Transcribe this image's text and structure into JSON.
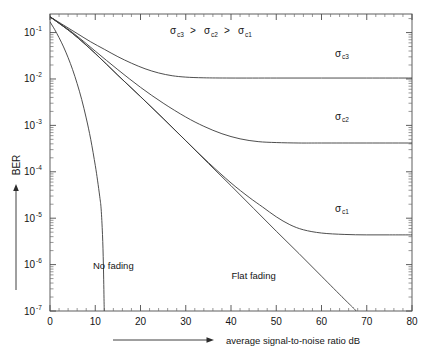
{
  "chart_data": {
    "type": "line",
    "title": "",
    "subtitle": "",
    "xlabel": "average signal-to-noise ratio  dB",
    "ylabel": "BER",
    "xlim": [
      0,
      80
    ],
    "ylim_log": [
      -7,
      -0.6
    ],
    "x_ticks": [
      0,
      10,
      20,
      30,
      40,
      50,
      60,
      70,
      80
    ],
    "x_tick_labels": [
      "0",
      "10",
      "20",
      "30",
      "40",
      "50",
      "60",
      "70",
      "80"
    ],
    "y_ticks_exponent": [
      -1,
      -2,
      -3,
      -4,
      -5,
      -6,
      -7
    ],
    "y_tick_labels": [
      "10-1",
      "10-2",
      "10-3",
      "10-4",
      "10-5",
      "10-6",
      "10-7"
    ],
    "y_tick_base": "10",
    "y_tick_exponents": [
      "-1",
      "-2",
      "-3",
      "-4",
      "-5",
      "-6",
      "-7"
    ],
    "grid": false,
    "legend_position": "inline-annotations",
    "annotation_inequality": {
      "parts": [
        {
          "base": "σ",
          "sub": "c3"
        },
        {
          "text": " > "
        },
        {
          "base": "σ",
          "sub": "c2"
        },
        {
          "text": " > "
        },
        {
          "base": "σ",
          "sub": "c1"
        }
      ],
      "plain": "σc3 > σc2 > σc1"
    },
    "series": [
      {
        "name": "No fading",
        "label": "No fading",
        "label_x_db": 14,
        "label_y_exp": -6.1,
        "floor_exp": null,
        "points": [
          [
            0,
            -0.77
          ],
          [
            1,
            -0.93
          ],
          [
            2,
            -1.11
          ],
          [
            3,
            -1.31
          ],
          [
            4,
            -1.54
          ],
          [
            5,
            -1.8
          ],
          [
            6,
            -2.1
          ],
          [
            7,
            -2.44
          ],
          [
            8,
            -2.84
          ],
          [
            9,
            -3.3
          ],
          [
            10,
            -3.86
          ],
          [
            10.5,
            -4.18
          ],
          [
            11,
            -4.54
          ],
          [
            11.3,
            -4.8
          ],
          [
            11.6,
            -5.35
          ],
          [
            11.8,
            -6.0
          ],
          [
            11.95,
            -6.8
          ],
          [
            12.0,
            -7.0
          ]
        ]
      },
      {
        "name": "Flat fading",
        "label": "Flat fading",
        "label_x_db": 45,
        "label_y_exp": -6.3,
        "floor_exp": null,
        "points": [
          [
            0,
            -0.66
          ],
          [
            5,
            -1.02
          ],
          [
            10,
            -1.45
          ],
          [
            15,
            -1.92
          ],
          [
            20,
            -2.38
          ],
          [
            25,
            -2.85
          ],
          [
            30,
            -3.33
          ],
          [
            35,
            -3.82
          ],
          [
            40,
            -4.3
          ],
          [
            45,
            -4.79
          ],
          [
            50,
            -5.28
          ],
          [
            55,
            -5.76
          ],
          [
            60,
            -6.25
          ],
          [
            65,
            -6.74
          ],
          [
            67.2,
            -6.95
          ],
          [
            67.6,
            -7.0
          ]
        ]
      },
      {
        "name": "sigma_c1",
        "label": "σc1",
        "label_base": "σ",
        "label_sub": "c1",
        "label_x_db": 63,
        "label_y_exp": -4.86,
        "floor_exp": -5.35,
        "points": [
          [
            0,
            -0.66
          ],
          [
            5,
            -1.02
          ],
          [
            10,
            -1.45
          ],
          [
            15,
            -1.92
          ],
          [
            20,
            -2.38
          ],
          [
            25,
            -2.85
          ],
          [
            30,
            -3.33
          ],
          [
            35,
            -3.8
          ],
          [
            40,
            -4.24
          ],
          [
            44,
            -4.55
          ],
          [
            47,
            -4.76
          ],
          [
            50,
            -4.97
          ],
          [
            53,
            -5.14
          ],
          [
            56,
            -5.25
          ],
          [
            60,
            -5.32
          ],
          [
            65,
            -5.35
          ],
          [
            70,
            -5.36
          ],
          [
            75,
            -5.36
          ],
          [
            80,
            -5.36
          ]
        ]
      },
      {
        "name": "sigma_c2",
        "label": "σc2",
        "label_base": "σ",
        "label_sub": "c2",
        "label_x_db": 63,
        "label_y_exp": -2.88,
        "floor_exp": -3.37,
        "points": [
          [
            0,
            -0.66
          ],
          [
            5,
            -1.0
          ],
          [
            10,
            -1.4
          ],
          [
            15,
            -1.8
          ],
          [
            20,
            -2.18
          ],
          [
            25,
            -2.52
          ],
          [
            30,
            -2.82
          ],
          [
            34,
            -3.02
          ],
          [
            38,
            -3.18
          ],
          [
            42,
            -3.29
          ],
          [
            46,
            -3.35
          ],
          [
            50,
            -3.37
          ],
          [
            55,
            -3.38
          ],
          [
            60,
            -3.38
          ],
          [
            70,
            -3.38
          ],
          [
            80,
            -3.38
          ]
        ]
      },
      {
        "name": "sigma_c3",
        "label": "σc3",
        "label_base": "σ",
        "label_sub": "c3",
        "label_x_db": 63,
        "label_y_exp": -1.52,
        "floor_exp": -1.97,
        "points": [
          [
            0,
            -0.66
          ],
          [
            3,
            -0.84
          ],
          [
            6,
            -1.02
          ],
          [
            9,
            -1.2
          ],
          [
            12,
            -1.36
          ],
          [
            15,
            -1.52
          ],
          [
            18,
            -1.66
          ],
          [
            21,
            -1.78
          ],
          [
            24,
            -1.87
          ],
          [
            27,
            -1.93
          ],
          [
            30,
            -1.96
          ],
          [
            34,
            -1.975
          ],
          [
            40,
            -1.98
          ],
          [
            50,
            -1.98
          ],
          [
            60,
            -1.98
          ],
          [
            70,
            -1.98
          ],
          [
            80,
            -1.98
          ]
        ]
      }
    ]
  },
  "axes": {
    "x_title": "average signal-to-noise ratio  dB",
    "y_title": "BER",
    "x_arrow": true,
    "y_arrow": true
  }
}
